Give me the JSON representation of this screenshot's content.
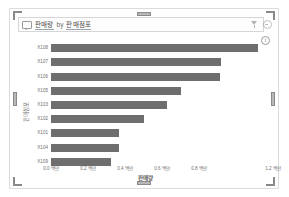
{
  "visual": {
    "title_main": "판매량",
    "title_by": "by",
    "title_dim": "판매점포",
    "icons": {
      "visual_type": "bar-chart-icon",
      "filter": "filter-icon",
      "more": "more-options-icon",
      "info": "info-icon",
      "info_glyph": "i"
    }
  },
  "chart_data": {
    "type": "bar",
    "orientation": "horizontal",
    "title": "판매량 by 판매점포",
    "xlabel": "판매량",
    "ylabel": "판매점포",
    "categories": [
      "X108",
      "X107",
      "X106",
      "X105",
      "X103",
      "X102",
      "X101",
      "X104",
      "X109"
    ],
    "values": [
      1.12,
      0.92,
      0.915,
      0.705,
      0.625,
      0.5,
      0.37,
      0.365,
      0.325
    ],
    "value_unit": "백만",
    "xlim": [
      0,
      1.2
    ],
    "xticks": [
      0.0,
      0.2,
      0.4,
      0.6,
      0.8,
      1.2
    ],
    "xtick_labels": [
      "0.0 백만",
      "0.2 백만",
      "0.4 백만",
      "0.6 백만",
      "0.8 백만",
      "1.2 백만"
    ],
    "grid": false,
    "legend": null,
    "bar_color": "#6e6e6e"
  }
}
